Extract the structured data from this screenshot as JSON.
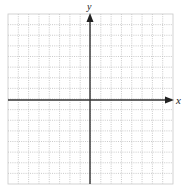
{
  "diagram": {
    "type": "coordinate-grid",
    "axes": {
      "x_label": "x",
      "y_label": "y",
      "color": "#333333"
    },
    "grid": {
      "columns": 16,
      "rows": 16,
      "line_color": "#bdbdbd",
      "line_style": "dotted"
    }
  }
}
